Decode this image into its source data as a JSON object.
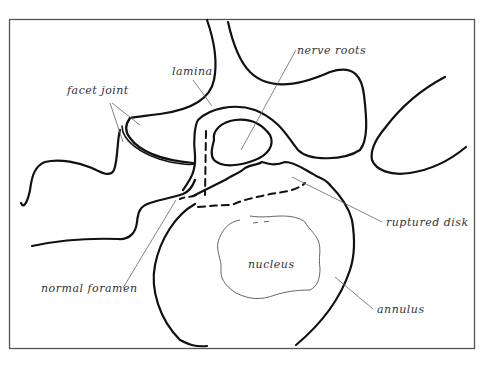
{
  "diagram": {
    "labels": {
      "facet_joint": "facet joint",
      "lamina": "lamina",
      "nerve_roots": "nerve roots",
      "ruptured_disk": "ruptured disk",
      "nucleus": "nucleus",
      "annulus": "annulus",
      "normal_foramen": "normal foramen"
    },
    "colors": {
      "line": "#111111",
      "frame": "#555555",
      "leader": "#666666",
      "background": "#ffffff"
    }
  }
}
